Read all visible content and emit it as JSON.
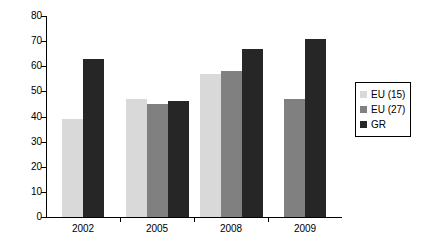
{
  "chart_data": {
    "type": "bar",
    "title": "",
    "subtitle": "",
    "xlabel": "",
    "ylabel": "",
    "categories": [
      "2002",
      "2005",
      "2008",
      "2009"
    ],
    "series": [
      {
        "name": "EU (15)",
        "color": "#d9d9d9",
        "values": [
          39,
          47,
          57,
          null
        ]
      },
      {
        "name": "EU (27)",
        "color": "#808080",
        "values": [
          null,
          45,
          58,
          47
        ]
      },
      {
        "name": "GR",
        "color": "#262626",
        "values": [
          63,
          46,
          67,
          71
        ]
      }
    ],
    "ylim": [
      0,
      80
    ],
    "ytick_step": 10,
    "yticks": [
      0,
      10,
      20,
      30,
      40,
      50,
      60,
      70,
      80
    ],
    "ytick_labels": [
      "0",
      "10",
      "20",
      "30",
      "40",
      "50",
      "60",
      "70",
      "80"
    ],
    "grid": false,
    "legend_position": "right"
  },
  "legend": {
    "entries": [
      {
        "label": "EU (15)",
        "swatch": "eu15"
      },
      {
        "label": "EU (27)",
        "swatch": "eu27"
      },
      {
        "label": "GR",
        "swatch": "gr"
      }
    ]
  }
}
